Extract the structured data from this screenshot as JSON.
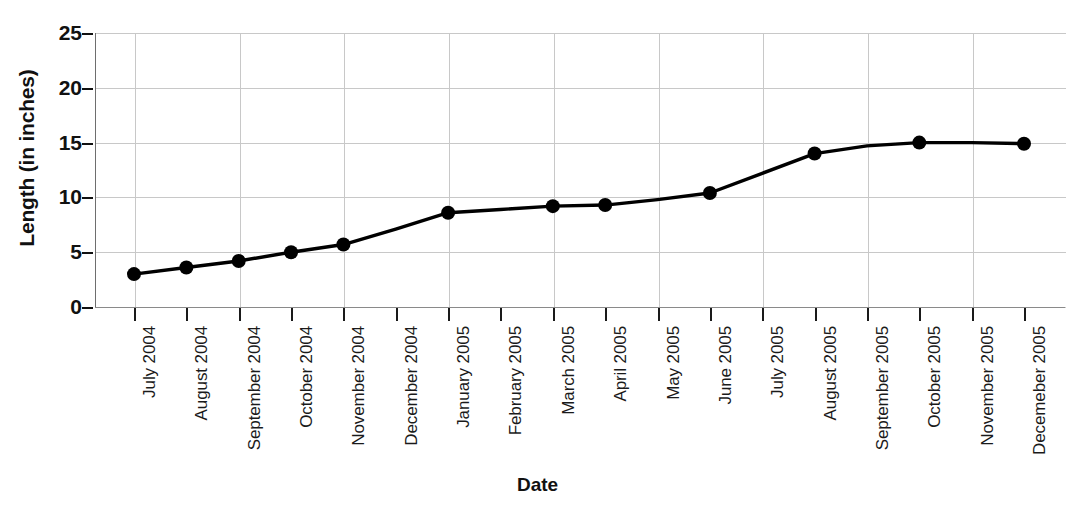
{
  "chart_data": {
    "type": "line",
    "title": "",
    "xlabel": "Date",
    "ylabel": "Length (in inches)",
    "ylim": [
      0,
      25
    ],
    "yticks": [
      0,
      5,
      10,
      15,
      20,
      25
    ],
    "grid": true,
    "legend": "none",
    "marker": "filled-circle",
    "line_color": "#000000",
    "grid_color": "#c8c8c8",
    "categories": [
      "July 2004",
      "August 2004",
      "September 2004",
      "October 2004",
      "November 2004",
      "December 2004",
      "January 2005",
      "February 2005",
      "March 2005",
      "April 2005",
      "May 2005",
      "June 2005",
      "July 2005",
      "August 2005",
      "September 2005",
      "October 2005",
      "November 2005",
      "Decemeber 2005"
    ],
    "points": [
      {
        "x": "July 2004",
        "y": 3.0,
        "marker": true
      },
      {
        "x": "August 2004",
        "y": 3.6,
        "marker": true
      },
      {
        "x": "September 2004",
        "y": 4.2,
        "marker": true
      },
      {
        "x": "October 2004",
        "y": 5.0,
        "marker": true
      },
      {
        "x": "November 2004",
        "y": 5.7,
        "marker": true
      },
      {
        "x": "December 2004",
        "y": 7.1,
        "marker": false
      },
      {
        "x": "January 2005",
        "y": 8.6,
        "marker": true
      },
      {
        "x": "February 2005",
        "y": 8.9,
        "marker": false
      },
      {
        "x": "March 2005",
        "y": 9.2,
        "marker": true
      },
      {
        "x": "April 2005",
        "y": 9.3,
        "marker": true
      },
      {
        "x": "May 2005",
        "y": 9.8,
        "marker": false
      },
      {
        "x": "June 2005",
        "y": 10.4,
        "marker": true
      },
      {
        "x": "July 2005",
        "y": 12.2,
        "marker": false
      },
      {
        "x": "August 2005",
        "y": 14.0,
        "marker": true
      },
      {
        "x": "September 2005",
        "y": 14.7,
        "marker": false
      },
      {
        "x": "October 2005",
        "y": 15.0,
        "marker": true
      },
      {
        "x": "November 2005",
        "y": 15.0,
        "marker": false
      },
      {
        "x": "Decemeber 2005",
        "y": 14.9,
        "marker": true
      }
    ],
    "values": [
      3.0,
      3.6,
      4.2,
      5.0,
      5.7,
      7.1,
      8.6,
      8.9,
      9.2,
      9.3,
      9.8,
      10.4,
      12.2,
      14.0,
      14.7,
      15.0,
      15.0,
      14.9
    ]
  }
}
